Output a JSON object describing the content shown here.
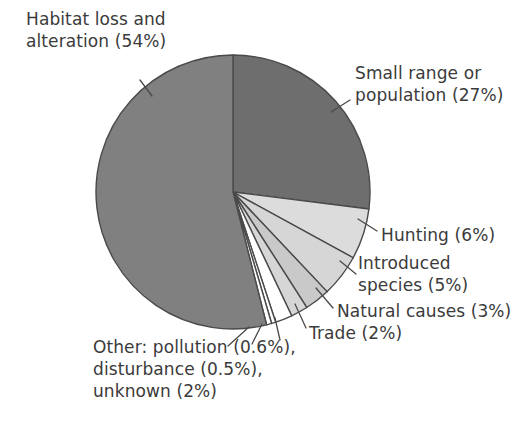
{
  "chart_data": {
    "type": "pie",
    "title": "",
    "subtitle": "",
    "xlabel": "",
    "ylabel": "",
    "legend_position": "none",
    "grid": false,
    "labels_placement": "outside-with-leader-lines",
    "start_angle_clock": "12 o'clock",
    "direction": "clockwise",
    "categories": [
      "Small range or population",
      "Hunting",
      "Introduced species",
      "Natural causes",
      "Trade",
      "unknown",
      "disturbance",
      "pollution",
      "Habitat loss and alteration"
    ],
    "values": [
      27,
      6,
      5,
      3,
      2,
      2,
      0.5,
      0.6,
      54
    ],
    "slices": [
      {
        "name": "Small range or population",
        "value": 27,
        "display": "27%",
        "color": "#6e6e6e"
      },
      {
        "name": "Hunting",
        "value": 6,
        "display": "6%",
        "color": "#dcdcdc"
      },
      {
        "name": "Introduced species",
        "value": 5,
        "display": "5%",
        "color": "#d6d6d6"
      },
      {
        "name": "Natural causes",
        "value": 3,
        "display": "3%",
        "color": "#c9c9c9"
      },
      {
        "name": "Trade",
        "value": 2,
        "display": "2%",
        "color": "#d6d6d6"
      },
      {
        "name": "unknown",
        "value": 2,
        "display": "2%",
        "color": "#ffffff"
      },
      {
        "name": "disturbance",
        "value": 0.5,
        "display": "0.5%",
        "color": "#ffffff"
      },
      {
        "name": "pollution",
        "value": 0.6,
        "display": "0.6%",
        "color": "#ffffff"
      },
      {
        "name": "Habitat loss and alteration",
        "value": 54,
        "display": "54%",
        "color": "#808080"
      }
    ]
  },
  "labels": {
    "habitat": "Habitat loss and\nalteration (54%)",
    "small_range": "Small range or\npopulation (27%)",
    "hunting": "Hunting (6%)",
    "introduced": "Introduced\nspecies (5%)",
    "natural_causes": "Natural causes (3%)",
    "trade": "Trade (2%)",
    "other": "Other: pollution (0.6%),\ndisturbance (0.5%),\nunknown (2%)"
  },
  "style": {
    "background": "#ffffff",
    "text_color": "#3b3b3b",
    "outline_color": "#4a4a4a",
    "leader_line_color": "#4a4a4a"
  }
}
